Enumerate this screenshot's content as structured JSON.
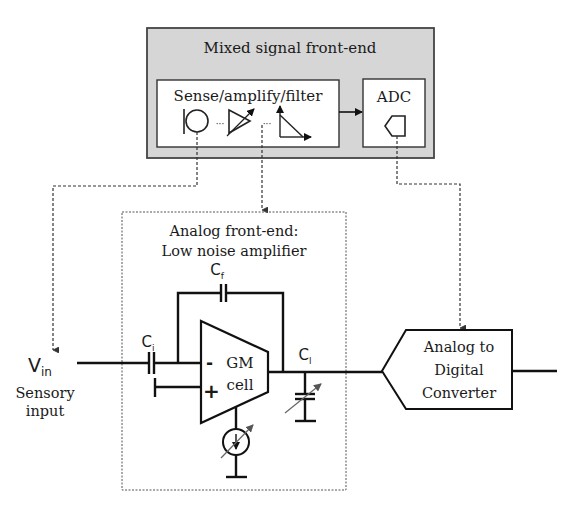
{
  "mixed_signal": {
    "title": "Mixed signal front-end",
    "sense_block": "Sense/amplify/filter",
    "adc_block": "ADC",
    "ellipsis": "···",
    "colors": {
      "panel_fill": "#d6d6d6",
      "panel_border": "#444444"
    }
  },
  "lna": {
    "title_line1": "Analog front-end:",
    "title_line2": "Low noise amplifier",
    "cf_label": "C",
    "cf_sub": "f",
    "ci_label": "C",
    "ci_sub": "i",
    "cl_label": "C",
    "cl_sub": "l",
    "gm_line1": "GM",
    "gm_line2": "cell",
    "minus": "-",
    "plus": "+"
  },
  "input": {
    "v_label": "V",
    "v_sub": "in",
    "caption_line1": "Sensory",
    "caption_line2": "input"
  },
  "converter": {
    "line1": "Analog to",
    "line2": "Digital",
    "line3": "Converter"
  }
}
